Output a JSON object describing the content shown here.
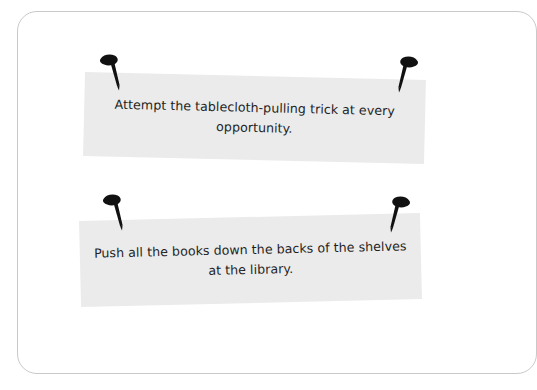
{
  "card": {
    "background_color": "#ffffff",
    "border_color": "#c9c9c9"
  },
  "notes": [
    {
      "id": "note-1",
      "text": "Attempt the tablecloth-pulling trick at every opportunity.",
      "paper_color": "#ebebeb",
      "text_color": "#1f1f1f",
      "pins": [
        "pushpin-icon",
        "pushpin-icon"
      ]
    },
    {
      "id": "note-2",
      "text": "Push all the books down the backs of the shelves at the library.",
      "paper_color": "#ebebeb",
      "text_color": "#1f1f1f",
      "pins": [
        "pushpin-icon",
        "pushpin-icon"
      ]
    }
  ]
}
